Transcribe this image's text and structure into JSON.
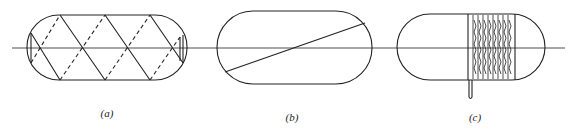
{
  "figure": {
    "panels": [
      {
        "id": "a",
        "label": "(a)",
        "description": "capsule with helical winding (solid front, dashed back) around horizontal axis"
      },
      {
        "id": "b",
        "label": "(b)",
        "description": "capsule with single diagonal line crossing axis"
      },
      {
        "id": "c",
        "label": "(c)",
        "description": "capsule with dense coil windings on right half and a lead extending downward"
      }
    ],
    "colors": {
      "stroke": "#222222",
      "background": "#ffffff"
    }
  }
}
